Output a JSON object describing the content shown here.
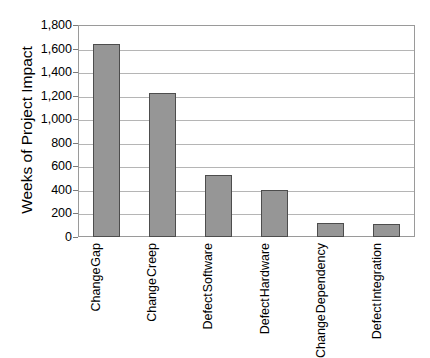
{
  "chart_data": {
    "type": "bar",
    "title": "",
    "xlabel": "",
    "ylabel": "Weeks of Project Impact",
    "ylim": [
      0,
      1800
    ],
    "ytick_step": 200,
    "grid": true,
    "legend": "none",
    "orientation": "vertical",
    "bar_color": "#969696",
    "bar_border_color": "#4d4d4d",
    "gridline_color": "#b5b5b5",
    "axis_color": "#9a9a9a",
    "background_color": "#ffffff",
    "ytick_labels": [
      "1,800",
      "1,600",
      "1,400",
      "1,200",
      "1,000",
      "800",
      "600",
      "400",
      "200",
      "0"
    ],
    "ytick_values": [
      1800,
      1600,
      1400,
      1200,
      1000,
      800,
      600,
      400,
      200,
      0
    ],
    "categories": [
      "Change Gap",
      "Change Creep",
      "Defect Software",
      "Defect Hardware",
      "Change Dependency",
      "Defect Integration"
    ],
    "category_lines": [
      [
        "Change",
        "Gap"
      ],
      [
        "Change",
        "Creep"
      ],
      [
        "Defect",
        "Software"
      ],
      [
        "Defect",
        "Hardware"
      ],
      [
        "Change",
        "Dependency"
      ],
      [
        "Defect",
        "Integration"
      ]
    ],
    "values": [
      1640,
      1220,
      525,
      395,
      115,
      110
    ]
  }
}
